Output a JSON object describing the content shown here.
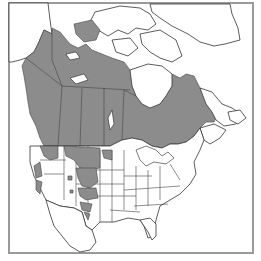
{
  "map": {
    "type": "species range map",
    "region": "North America (Canada, United States, northern Mexico)",
    "legend": null,
    "colors": {
      "background": "#ffffff",
      "frame": "#9a9a9a",
      "range_fill": "#8c8c8c",
      "outline": "#333333"
    },
    "range_areas": [
      "Canada (boreal region, Yukon to Labrador/Quebec)",
      "Alaska panhandle coast",
      "Northern Rocky Mountains (Montana, Idaho, Wyoming)",
      "Colorado / Utah mountains",
      "New Mexico / Arizona high elevations (patchy)",
      "Pacific Northwest coast (patchy)"
    ]
  }
}
